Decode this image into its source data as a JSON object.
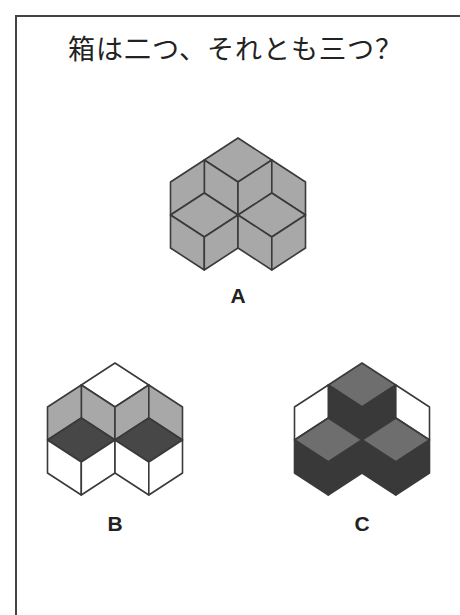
{
  "title": "箱は二つ、それとも三つ？",
  "colors": {
    "stroke": "#3a3a3a",
    "white": "#ffffff",
    "light_gray": "#a8a8a8",
    "dark_gray": "#474747",
    "mid_gray": "#6e6e6e",
    "very_dark": "#393939"
  },
  "figures": [
    {
      "id": "A",
      "label": "A",
      "center": [
        238,
        215
      ],
      "label_pos": [
        218,
        284
      ],
      "faces": {
        "top_rhombus": "light_gray",
        "top_cube_left": "light_gray",
        "top_cube_right": "light_gray",
        "outer_left_upper": "light_gray",
        "outer_right_upper": "light_gray",
        "left_rhombus": "light_gray",
        "right_rhombus": "light_gray",
        "left_cube_left": "light_gray",
        "left_cube_right": "light_gray",
        "right_cube_left": "light_gray",
        "right_cube_right": "light_gray"
      }
    },
    {
      "id": "B",
      "label": "B",
      "center": [
        115,
        440
      ],
      "label_pos": [
        95,
        512
      ],
      "faces": {
        "top_rhombus": "white",
        "top_cube_left": "light_gray",
        "top_cube_right": "light_gray",
        "outer_left_upper": "light_gray",
        "outer_right_upper": "light_gray",
        "left_rhombus": "dark_gray",
        "right_rhombus": "dark_gray",
        "left_cube_left": "white",
        "left_cube_right": "white",
        "right_cube_left": "white",
        "right_cube_right": "white"
      }
    },
    {
      "id": "C",
      "label": "C",
      "center": [
        362,
        440
      ],
      "label_pos": [
        342,
        512
      ],
      "faces": {
        "top_rhombus": "mid_gray",
        "top_cube_left": "very_dark",
        "top_cube_right": "very_dark",
        "outer_left_upper": "white",
        "outer_right_upper": "white",
        "left_rhombus": "mid_gray",
        "right_rhombus": "mid_gray",
        "left_cube_left": "very_dark",
        "left_cube_right": "very_dark",
        "right_cube_left": "very_dark",
        "right_cube_right": "very_dark"
      }
    }
  ],
  "geometry": {
    "w": 33.75,
    "hh": 22,
    "e": 33
  }
}
